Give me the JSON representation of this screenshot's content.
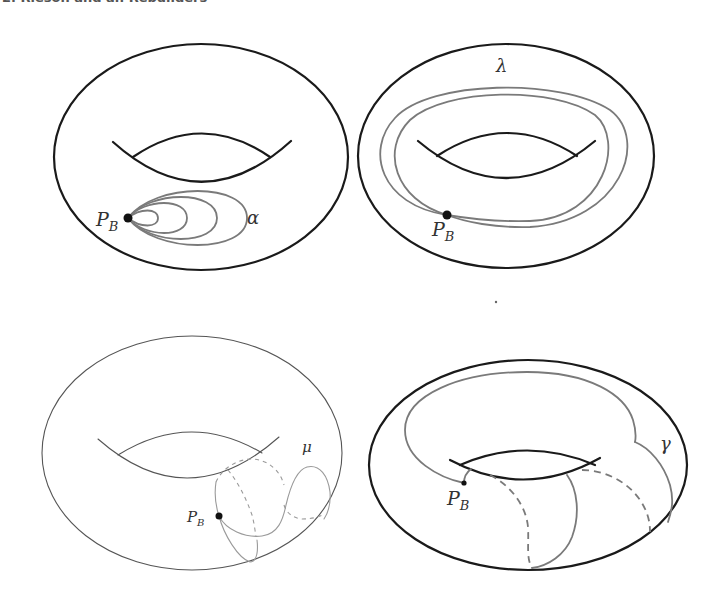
{
  "header": {
    "text": "2. Rieson and an Rebuilders"
  },
  "colors": {
    "torus_stroke": "#1a1a1a",
    "torus_stroke_light": "#555555",
    "curve_gray": "#7a7a7a",
    "curve_light": "#9a9a9a",
    "point_fill": "#111111",
    "label_color": "#333333"
  },
  "panels": [
    {
      "id": "top-left",
      "curve_name": "alpha",
      "curve_label": "α",
      "point_label": "P",
      "point_subscript": "B",
      "torus": {
        "cx": 201,
        "cy": 157,
        "rx": 147,
        "ry": 113,
        "stroke_width": 2.2
      },
      "hole_lower": "M 113 142 Q 202 222 291 141",
      "hole_upper": "M 133 157 Q 202 110 270 157",
      "point": {
        "x": 128,
        "y": 218,
        "r": 4.5
      },
      "point_label_pos": {
        "x": 96,
        "y": 226
      },
      "curve_label_pos": {
        "x": 247,
        "y": 224
      },
      "curves": [
        "M 128 218 C 140 208, 158 208, 158 218 C 158 228, 140 228, 128 218",
        "M 128 218 C 145 198, 187 198, 187 218 C 187 238, 145 238, 128 218",
        "M 128 218 C 150 190, 217 190, 217 218 C 217 246, 150 246, 128 218",
        "M 128 218 C 155 182, 247 182, 247 218 C 247 254, 155 254, 128 218"
      ],
      "dashed_curves": []
    },
    {
      "id": "top-right",
      "curve_name": "lambda",
      "curve_label": "λ",
      "point_label": "P",
      "point_subscript": "B",
      "torus": {
        "cx": 506,
        "cy": 156,
        "rx": 148,
        "ry": 112,
        "stroke_width": 2.2
      },
      "hole_lower": "M 418 141 Q 506 215 595 141",
      "hole_upper": "M 437 156 Q 507 110 577 156",
      "point": {
        "x": 447,
        "y": 215,
        "r": 4.5
      },
      "point_label_pos": {
        "x": 432,
        "y": 236
      },
      "curve_label_pos": {
        "x": 496,
        "y": 72
      },
      "curves": [
        "M 447 215 C 380 205, 365 150, 395 118 C 430 80, 560 78, 610 110 C 650 140, 620 222, 530 227 C 495 228, 465 222, 447 215",
        "M 447 215 C 395 200, 380 150, 410 120 C 445 88, 555 86, 595 115 C 625 140, 605 218, 530 221 C 495 222, 465 218, 447 215"
      ],
      "dashed_curves": []
    },
    {
      "id": "bottom-left",
      "curve_name": "mu",
      "curve_label": "μ",
      "point_label": "P",
      "point_subscript": "B",
      "torus": {
        "cx": 192,
        "cy": 453,
        "rx": 150,
        "ry": 117,
        "stroke_width": 1.1
      },
      "hole_lower": "M 98 439 Q 188 518 279 437",
      "hole_upper": "M 118 455 Q 190 410 262 453",
      "point": {
        "x": 219,
        "y": 516,
        "r": 3.5
      },
      "point_label_pos": {
        "x": 187,
        "y": 522
      },
      "curve_label_pos": {
        "x": 302,
        "y": 452
      },
      "curves": [
        "M 216 482 C 214 495, 216 507, 219 516 C 224 535, 238 558, 250 562 C 258 562, 258 548, 257 540",
        "M 219 516 C 226 530, 245 538, 262 536 C 278 534, 283 520, 286 505 C 290 488, 296 470, 307 467 C 320 464, 328 476, 330 492 C 331 505, 328 513, 324 519"
      ],
      "dashed_curves": [
        "M 216 482 C 222 468, 238 459, 252 459 C 268 460, 280 470, 284 485",
        "M 228 470 C 238 482, 246 498, 252 515 C 254 522, 255 530, 256 537",
        "M 284 505 C 286 512, 292 518, 302 519 C 312 519, 319 517, 324 514"
      ]
    },
    {
      "id": "bottom-right",
      "curve_name": "gamma",
      "curve_label": "γ",
      "point_label": "P",
      "point_subscript": "B",
      "torus": {
        "cx": 528,
        "cy": 465,
        "rx": 159,
        "ry": 105,
        "stroke_width": 2.2
      },
      "hole_lower": "M 450 460 Q 525 500 600 458",
      "hole_upper": "M 460 465 Q 527 436 595 465",
      "point": {
        "x": 464,
        "y": 483,
        "r": 2.6
      },
      "point_label_pos": {
        "x": 447,
        "y": 505
      },
      "curve_label_pos": {
        "x": 660,
        "y": 450
      },
      "curves": [
        "M 464 483 C 440 478, 405 460, 405 430 C 405 395, 460 372, 527 372 C 590 372, 625 395, 633 420 C 636 430, 636 437, 635 442",
        "M 635 442 C 650 448, 664 465, 670 485 C 674 500, 672 510, 668 522",
        "M 464 483 C 464 477, 467 472, 471 469",
        "M 567 475 C 578 490, 580 515, 572 537 C 565 555, 548 566, 532 568"
      ],
      "dashed_curves": [
        "M 490 475 C 510 485, 526 505, 528 527 C 529 545, 526 558, 532 568",
        "M 582 470 C 605 470, 628 482, 640 500 C 648 512, 650 522, 650 532"
      ]
    }
  ],
  "stray_mark": {
    "x": 496,
    "y": 302,
    "r": 1.2
  }
}
